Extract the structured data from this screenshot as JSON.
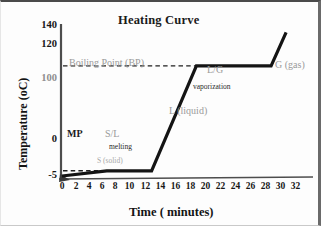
{
  "chart_data": {
    "type": "line",
    "title": "Heating Curve",
    "xlabel": "Time  ( minutes)",
    "ylabel": "Temperature (oC)",
    "xlim": [
      0,
      32
    ],
    "ylim": [
      -5,
      140
    ],
    "grid": false,
    "legend": "none",
    "x_ticks": [
      "0",
      "2",
      "4",
      "6",
      "8",
      "10",
      "12",
      "14",
      "16",
      "18",
      "20",
      "22",
      "24",
      "26",
      "28",
      "30",
      "32"
    ],
    "y_ticks": [
      "140",
      "120",
      "100",
      "0",
      "-5"
    ],
    "series": [
      {
        "name": "heating curve",
        "color": "#141414",
        "points": [
          {
            "x": 0,
            "y": -5
          },
          {
            "x": 6,
            "y": 0
          },
          {
            "x": 12,
            "y": 0
          },
          {
            "x": 18,
            "y": 100
          },
          {
            "x": 28,
            "y": 100
          },
          {
            "x": 30,
            "y": 132
          }
        ]
      }
    ],
    "reference_lines": [
      {
        "name": "melting-point-line",
        "y": 0,
        "x_from": 0,
        "x_to": 6,
        "style": "dashed",
        "color": "#1f1f1f"
      },
      {
        "name": "boiling-point-line",
        "y": 100,
        "x_from": 0,
        "x_to": 18,
        "style": "dashed",
        "color": "#1f1f1f"
      }
    ],
    "annotations": [
      {
        "name": "boiling-point-label",
        "text": "Boiling Point (BP)",
        "x": 2.0,
        "y": 112,
        "color": "#9a9a9a",
        "size": "large"
      },
      {
        "name": "melting-point-label",
        "text": "MP",
        "x": 1.6,
        "y": 8,
        "color": "#1c1c1c",
        "size": "large"
      },
      {
        "name": "solid-liquid-label",
        "text": "S/L",
        "x": 7.3,
        "y": 8,
        "color": "#9a9a9a",
        "size": "large"
      },
      {
        "name": "melting-label",
        "text": "melting",
        "x": 8.0,
        "y": -1,
        "color": "#2a2a2a",
        "size": "small"
      },
      {
        "name": "solid-label",
        "text": "S (solid)",
        "x": 6.2,
        "y": -19,
        "color": "#a8a8a8",
        "size": "small-gray"
      },
      {
        "name": "liquid-label",
        "text": "L (liquid)",
        "x": 16.2,
        "y": 52,
        "color": "#a8a8a8",
        "size": "large-gray"
      },
      {
        "name": "liquid-gas-label",
        "text": "L/G",
        "x": 20.4,
        "y": 113,
        "color": "#9a9a9a",
        "size": "large"
      },
      {
        "name": "vaporization-label",
        "text": "vaporization",
        "x": 19.6,
        "y": 88,
        "color": "#2a2a2a",
        "size": "small"
      },
      {
        "name": "gas-label",
        "text": "G (gas)",
        "x": 29.6,
        "y": 113,
        "color": "#a8a8a8",
        "size": "large-gray"
      }
    ]
  }
}
